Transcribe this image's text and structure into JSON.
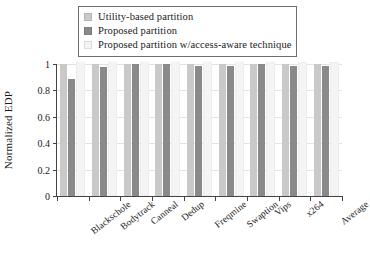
{
  "chart_data": {
    "type": "bar",
    "title": "",
    "xlabel": "",
    "ylabel": "Normalized EDP",
    "ylim": [
      0,
      1
    ],
    "yticks": [
      "0",
      "0.2",
      "0.4",
      "0.6",
      "0.8",
      "1"
    ],
    "ytick_values": [
      0,
      0.2,
      0.4,
      0.6,
      0.8,
      1
    ],
    "grid": true,
    "legend_position": "top-center",
    "categories": [
      "Blackschole",
      "Bodytrack",
      "Canneal",
      "Dedup",
      "Freqmine",
      "Swaption",
      "Vips",
      "x264",
      "Average"
    ],
    "series": [
      {
        "name": "Utility-based partition",
        "color": "#c9c9c9",
        "values": [
          1.0,
          1.0,
          1.0,
          1.0,
          1.0,
          1.0,
          1.0,
          1.0,
          1.0
        ]
      },
      {
        "name": "Proposed partition",
        "color": "#8a8a8a",
        "values": [
          0.89,
          0.98,
          1.0,
          1.0,
          0.985,
          0.985,
          1.0,
          0.985,
          0.985
        ]
      },
      {
        "name": "Proposed partition w/access-aware technique",
        "color": "#f4f4f4",
        "values": [
          1.0,
          1.0,
          1.0,
          1.0,
          1.0,
          1.0,
          1.0,
          1.0,
          1.0
        ]
      }
    ]
  },
  "legend": {
    "items": [
      {
        "label": "Utility-based partition",
        "color": "#c9c9c9"
      },
      {
        "label": "Proposed partition",
        "color": "#8a8a8a"
      },
      {
        "label": "Proposed partition w/access-aware technique",
        "color": "#f4f4f4"
      }
    ]
  },
  "axes": {
    "y_title": "Normalized EDP"
  }
}
